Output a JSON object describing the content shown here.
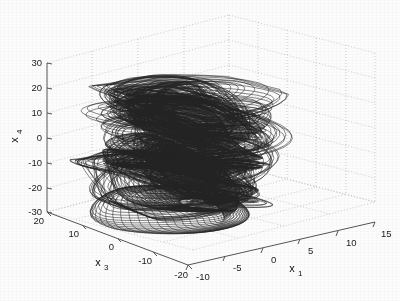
{
  "figure": {
    "type": "matlab-3d-plot",
    "background_color": "#fcfcfc",
    "line_color": "#232323",
    "grid_color": "#b9b9b9",
    "axis_color": "#555555"
  },
  "chart_data": {
    "type": "line",
    "projection": "3d",
    "title": "",
    "subtitle": "",
    "xlabel": "x_1",
    "ylabel": "x_3",
    "zlabel": "x_4",
    "grid": true,
    "legend": null,
    "legend_position": "none",
    "axes": {
      "x1": {
        "label": "x",
        "subscript": "1",
        "ticks": [
          -10,
          -5,
          0,
          5,
          10,
          15
        ],
        "tick_labels": [
          "-10",
          "-5",
          "0",
          "5",
          "10",
          "15"
        ],
        "range": [
          -10,
          15
        ]
      },
      "x3": {
        "label": "x",
        "subscript": "3",
        "ticks": [
          20,
          10,
          0,
          -10,
          -20
        ],
        "tick_labels": [
          "20",
          "10",
          "0",
          "-10",
          "-20"
        ],
        "range": [
          -20,
          20
        ]
      },
      "x4": {
        "label": "x",
        "subscript": "4",
        "ticks": [
          30,
          20,
          10,
          0,
          -10,
          -20,
          -30
        ],
        "tick_labels": [
          "30",
          "20",
          "10",
          "0",
          "-10",
          "-20",
          "-30"
        ],
        "range": [
          -30,
          30
        ]
      }
    },
    "series": [
      {
        "name": "trajectory",
        "color": "#232323",
        "n_points": 9000,
        "x1_extent": [
          -10.5,
          9.0
        ],
        "x3_extent": [
          -18.0,
          18.0
        ],
        "x4_extent": [
          -31.0,
          29.0
        ]
      }
    ]
  },
  "labels": {
    "x1_main": "x",
    "x1_sub": "1",
    "x3_main": "x",
    "x3_sub": "3",
    "x4_main": "x",
    "x4_sub": "4"
  },
  "ticks": {
    "x4": [
      "30",
      "20",
      "10",
      "0",
      "-10",
      "-20",
      "-30"
    ],
    "x3": [
      "20",
      "10",
      "0",
      "-10",
      "-20"
    ],
    "x1": [
      "-10",
      "-5",
      "0",
      "5",
      "10",
      "15"
    ]
  }
}
